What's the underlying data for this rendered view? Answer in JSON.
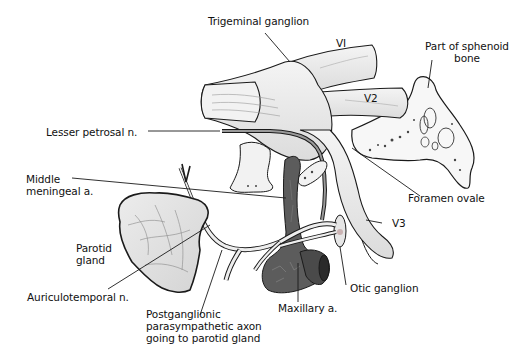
{
  "diagram": {
    "type": "anatomical-illustration",
    "labels": {
      "trigeminal_ganglion": "Trigeminal ganglion",
      "v1": "VI",
      "v2": "V2",
      "v3": "V3",
      "sphenoid_line1": "Part of sphenoid",
      "sphenoid_line2": "bone",
      "lesser_petrosal": "Lesser petrosal n.",
      "middle_meningeal_line1": "Middle",
      "middle_meningeal_line2": "meningeal a.",
      "foramen_ovale": "Foramen ovale",
      "parotid_line1": "Parotid",
      "parotid_line2": "gland",
      "auriculotemporal": "Auriculotemporal n.",
      "postganglionic_line1": "Postganglionic",
      "postganglionic_line2": "parasympathetic axon",
      "postganglionic_line3": "going to parotid gland",
      "maxillary": "Maxillary a.",
      "otic_ganglion": "Otic ganglion"
    },
    "colors": {
      "background": "#ffffff",
      "outline": "#1a1a1a",
      "nerve_fill": "#efefef",
      "artery_fill": "#5a5a5a",
      "gland_fill": "#e2e2e2",
      "bone_fill": "#f6f6f6"
    }
  }
}
